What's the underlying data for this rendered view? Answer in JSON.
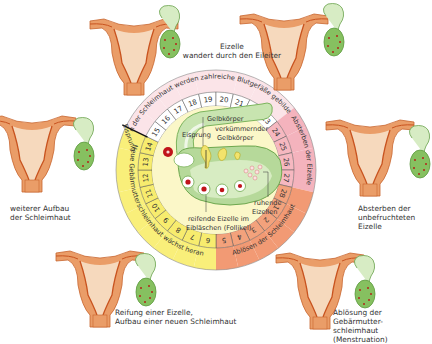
{
  "diagram": {
    "ring": {
      "days": [
        "1",
        "2",
        "3",
        "4",
        "5",
        "6",
        "7",
        "8",
        "9",
        "10",
        "11",
        "12",
        "13",
        "14",
        "15",
        "16",
        "17",
        "18",
        "19",
        "20",
        "21",
        "22",
        "23",
        "24",
        "25",
        "26",
        "27",
        "28"
      ],
      "phases": [
        {
          "name": "growth",
          "label": "Neue Gebärmutterschleimhaut wächst heran",
          "days": "6-14",
          "color": "#f7ec6e"
        },
        {
          "name": "vessels",
          "label": "In der Schleimhaut werden zahlreiche Blutgefäße gebildet",
          "days": "15-23",
          "color": "#fbe8ec"
        },
        {
          "name": "dying",
          "label": "Absterben der Eizelle",
          "days": "24-27",
          "color": "#f6b8c0"
        },
        {
          "name": "shedding",
          "label": "Ablösen der Schleimhaut",
          "days": "28-5",
          "color": "#f3a27c"
        }
      ],
      "ovulation_marker": "Eisprung"
    },
    "center": {
      "labels": {
        "ovulation": "Eisprung",
        "corpus_luteum": "Gelbkörper",
        "degenerating_corpus_luteum": "verkümmernder Gelbkörper",
        "resting_eggs": "ruhende Eizellen",
        "maturing_egg": "reifende Eizelle im Eibläschen (Follikel)"
      }
    },
    "stages": [
      {
        "id": "top",
        "caption": [
          "Eizelle",
          "wandert durch den Eileiter"
        ]
      },
      {
        "id": "left",
        "caption": [
          "weiterer Aufbau",
          "der Schleimhaut"
        ]
      },
      {
        "id": "right",
        "caption": [
          "Absterben der",
          "unbefruchteten",
          "Eizelle"
        ]
      },
      {
        "id": "bottom-left",
        "caption": [
          "Reifung einer Eizelle,",
          "Aufbau einer neuen Schleimhaut"
        ]
      },
      {
        "id": "bottom-right",
        "caption": [
          "Ablösung der Gebärmutter-",
          "schleimhaut (Menstruation)"
        ]
      }
    ],
    "colors": {
      "uterus": "#e89a63",
      "uterus_dark": "#c8531f",
      "lining": "#f6dcc4",
      "ovary": "#8cc46a",
      "ovary_light": "#d6ecc2",
      "egg": "#c01818"
    }
  }
}
